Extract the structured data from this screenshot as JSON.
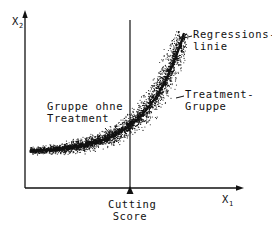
{
  "diagram": {
    "type": "regression-discontinuity-scatter",
    "axes": {
      "x_label": "X",
      "x_subscript": "1",
      "y_label": "X",
      "y_subscript": "2"
    },
    "labels": {
      "regression_line_1": "Regressions-",
      "regression_line_2": "linie",
      "treatment_group_1": "Treatment-",
      "treatment_group_2": "Gruppe",
      "control_group_1": "Gruppe ohne",
      "control_group_2": "Treatment",
      "cutting_score_1": "Cutting",
      "cutting_score_2": "Score"
    },
    "colors": {
      "ink": "#111111",
      "background": "#ffffff"
    },
    "geometry": {
      "origin": [
        25,
        188
      ],
      "x_axis_end": 243,
      "y_axis_top": 11,
      "cutoff_x": 130,
      "cutoff_top": 20,
      "curve_start": [
        30,
        151
      ],
      "curve_end": [
        184,
        33
      ]
    }
  }
}
